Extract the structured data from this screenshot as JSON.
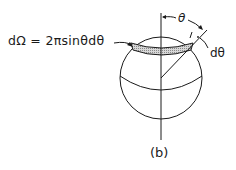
{
  "figure": {
    "caption": "(b)",
    "formula": "dΩ = 2πsinθdθ",
    "angle_label": "θ",
    "angle_increment_label": "dθ",
    "colors": {
      "line": "#1a1a1a",
      "band_fill": "#bdbdbd",
      "background": "#ffffff"
    }
  }
}
